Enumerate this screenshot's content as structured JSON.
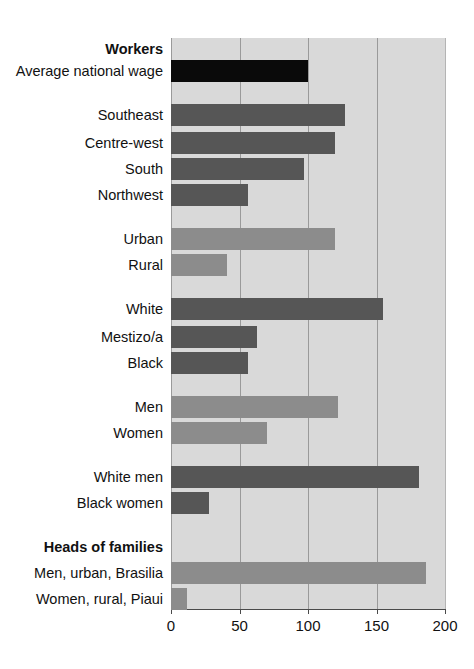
{
  "chart_data": {
    "type": "bar",
    "orientation": "horizontal",
    "title": "",
    "xlabel": "",
    "ylabel": "",
    "xlim": [
      0,
      200
    ],
    "xticks": [
      0,
      50,
      100,
      150,
      200
    ],
    "xtick_labels": [
      "0",
      "50",
      "100",
      "150",
      "200"
    ],
    "grid": true,
    "legend": "none",
    "plot_background": "#d9d9d9",
    "colors": {
      "black": "#0a0a0a",
      "dark_gray": "#565656",
      "medium_gray": "#8c8c8c",
      "gridline": "#9a9a9a",
      "axis": "#4a4a4a",
      "text": "#111111"
    },
    "groups": [
      {
        "heading": "Workers",
        "rows": [
          {
            "label": "Average national wage",
            "value": 100,
            "color": "black"
          }
        ]
      },
      {
        "heading": "",
        "rows": [
          {
            "label": "Southeast",
            "value": 127,
            "color": "dark_gray"
          },
          {
            "label": "Centre-west",
            "value": 120,
            "color": "dark_gray"
          },
          {
            "label": "South",
            "value": 97,
            "color": "dark_gray"
          },
          {
            "label": "Northwest",
            "value": 56,
            "color": "dark_gray"
          }
        ]
      },
      {
        "heading": "",
        "rows": [
          {
            "label": "Urban",
            "value": 120,
            "color": "medium_gray"
          },
          {
            "label": "Rural",
            "value": 41,
            "color": "medium_gray"
          }
        ]
      },
      {
        "heading": "",
        "rows": [
          {
            "label": "White",
            "value": 155,
            "color": "dark_gray"
          },
          {
            "label": "Mestizo/a",
            "value": 63,
            "color": "dark_gray"
          },
          {
            "label": "Black",
            "value": 56,
            "color": "dark_gray"
          }
        ]
      },
      {
        "heading": "",
        "rows": [
          {
            "label": "Men",
            "value": 122,
            "color": "medium_gray"
          },
          {
            "label": "Women",
            "value": 70,
            "color": "medium_gray"
          }
        ]
      },
      {
        "heading": "",
        "rows": [
          {
            "label": "White men",
            "value": 181,
            "color": "dark_gray"
          },
          {
            "label": "Black women",
            "value": 28,
            "color": "dark_gray"
          }
        ]
      },
      {
        "heading": "Heads of families",
        "rows": [
          {
            "label": "Men, urban, Brasilia",
            "value": 186,
            "color": "medium_gray"
          },
          {
            "label": "Women, rural, Piaui",
            "value": 12,
            "color": "medium_gray"
          }
        ]
      }
    ]
  },
  "layout": {
    "plot_left": 171,
    "plot_top": 38,
    "plot_width": 274,
    "plot_height": 571,
    "row_height": 22,
    "rows": [
      {
        "kind": "heading",
        "group": 0,
        "index": 0,
        "top": 38
      },
      {
        "kind": "bar",
        "group": 0,
        "index": 0,
        "top": 60
      },
      {
        "kind": "spacer",
        "top": 82
      },
      {
        "kind": "bar",
        "group": 1,
        "index": 0,
        "top": 104
      },
      {
        "kind": "bar",
        "group": 1,
        "index": 1,
        "top": 132
      },
      {
        "kind": "bar",
        "group": 1,
        "index": 2,
        "top": 158
      },
      {
        "kind": "bar",
        "group": 1,
        "index": 3,
        "top": 184
      },
      {
        "kind": "spacer",
        "top": 206
      },
      {
        "kind": "bar",
        "group": 2,
        "index": 0,
        "top": 228
      },
      {
        "kind": "bar",
        "group": 2,
        "index": 1,
        "top": 254
      },
      {
        "kind": "spacer",
        "top": 276
      },
      {
        "kind": "bar",
        "group": 3,
        "index": 0,
        "top": 298
      },
      {
        "kind": "bar",
        "group": 3,
        "index": 1,
        "top": 326
      },
      {
        "kind": "bar",
        "group": 3,
        "index": 2,
        "top": 352
      },
      {
        "kind": "spacer",
        "top": 374
      },
      {
        "kind": "bar",
        "group": 4,
        "index": 0,
        "top": 396
      },
      {
        "kind": "bar",
        "group": 4,
        "index": 1,
        "top": 422
      },
      {
        "kind": "spacer",
        "top": 444
      },
      {
        "kind": "bar",
        "group": 5,
        "index": 0,
        "top": 466
      },
      {
        "kind": "bar",
        "group": 5,
        "index": 1,
        "top": 492
      },
      {
        "kind": "spacer",
        "top": 514
      },
      {
        "kind": "heading",
        "group": 6,
        "index": 0,
        "top": 536
      },
      {
        "kind": "bar",
        "group": 6,
        "index": 0,
        "top": 562
      },
      {
        "kind": "bar",
        "group": 6,
        "index": 1,
        "top": 588
      }
    ]
  }
}
